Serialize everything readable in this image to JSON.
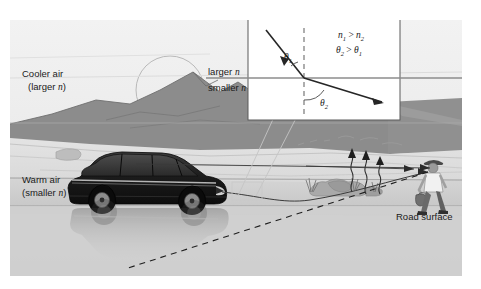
{
  "figure": {
    "kind": "physics-illustration",
    "background_color": "#ffffff"
  },
  "scene": {
    "sky_color": "#ebebeb",
    "mountain_color": "#8f8f8f",
    "ground_color": "#d6d6d6",
    "road_color": "#cccccc",
    "ray_color": "#3a3a3a",
    "labels": {
      "cooler_air_line1": "Cooler air",
      "cooler_air_line2_open": "(larger ",
      "cooler_air_n": "n",
      "cooler_air_line2_close": ")",
      "warm_air_line1": "Warm air",
      "warm_air_line2_open": "(smaller ",
      "warm_air_n": "n",
      "warm_air_line2_close": ")",
      "road_surface": "Road surface"
    },
    "objects": {
      "sun": "sun-circle",
      "vehicle": "minivan",
      "vehicle_reflection": "mirage-reflection-of-minivan",
      "observer": "person-walking-with-bag",
      "roadside": "rocks-and-grass",
      "heat_waves": "rising-heat-shimmer",
      "virtual_ray": "dashed-apparent-ray"
    }
  },
  "inset": {
    "border_color": "#5a5a5a",
    "background": "#ffffff",
    "interface_label_upper": "larger ",
    "interface_label_upper_n": "n",
    "interface_label_lower": "smaller ",
    "interface_label_lower_n": "n",
    "angle_incident": "θ",
    "angle_incident_sub": "1",
    "angle_refracted": "θ",
    "angle_refracted_sub": "2",
    "relation_n": {
      "left": "n",
      "left_sub": "1",
      "op": " > ",
      "right": "n",
      "right_sub": "2"
    },
    "relation_theta": {
      "left": "θ",
      "left_sub": "2",
      "op": " > ",
      "right": "θ",
      "right_sub": "1"
    },
    "normal_line": "dashed-normal",
    "interface_line": "refraction-interface",
    "ray": "refracted-light-ray"
  }
}
